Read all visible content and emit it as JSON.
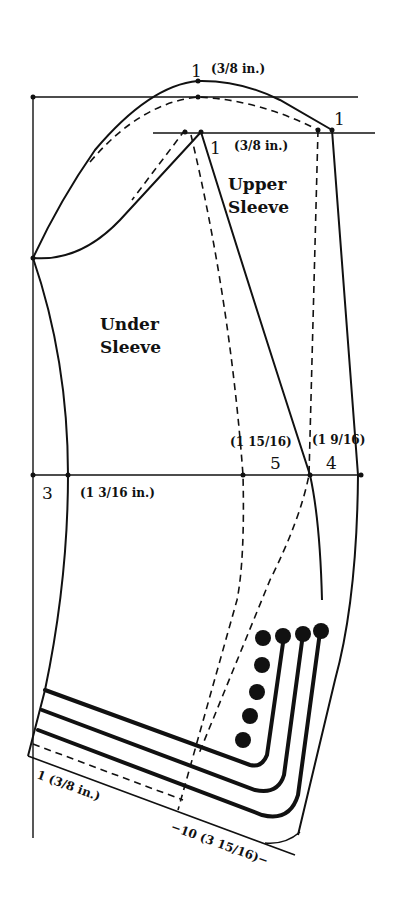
{
  "diagram": {
    "type": "sewing-pattern",
    "colors": {
      "ink": "#111111",
      "background": "#ffffff"
    },
    "pieces": [
      {
        "id": "upper",
        "line1": "Upper",
        "line2": "Sleeve"
      },
      {
        "id": "under",
        "line1": "Under",
        "line2": "Sleeve"
      }
    ],
    "annotations": {
      "cap_top_num": "1",
      "cap_top_measure": "(3/8 in.)",
      "upper_left_num": "1",
      "upper_measure": "(3/8 in.)",
      "upper_right_num": "1",
      "elbow_left_num": "3",
      "elbow_left_measure": "(1 3/16 in.)",
      "elbow_mid_measure": "(1 15/16)",
      "elbow_mid_num": "5",
      "elbow_right_measure": "(1 9/16)",
      "elbow_right_num": "4",
      "hem_left": "1 (3/8 in.)",
      "hem_bottom": "−10 (3 15/16)−"
    },
    "buttons": {
      "count": 8
    }
  }
}
